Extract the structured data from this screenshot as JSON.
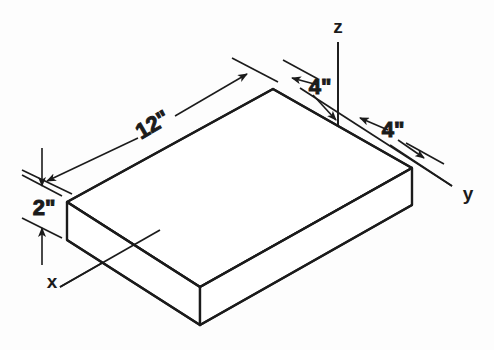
{
  "figure": {
    "background_color": "#fdfdfd",
    "line_color": "#1b1b1b",
    "solid": {
      "name": "rectangular-block",
      "shape": "rectangular-prism"
    },
    "dimensions": [
      {
        "id": "length",
        "label": "12\"",
        "value": 12,
        "unit": "inch",
        "edge": "long-top-edge"
      },
      {
        "id": "thickness",
        "label": "2\"",
        "value": 2,
        "unit": "inch",
        "edge": "vertical-left-edge"
      },
      {
        "id": "width-back",
        "label": "4\"",
        "value": 4,
        "unit": "inch",
        "edge": "back-top-edge"
      },
      {
        "id": "width-front",
        "label": "4\"",
        "value": 4,
        "unit": "inch",
        "edge": "right-top-edge"
      }
    ],
    "axes": [
      {
        "id": "z",
        "label": "z",
        "direction": "vertical-up"
      },
      {
        "id": "y",
        "label": "y",
        "direction": "lower-right"
      },
      {
        "id": "x",
        "label": "x",
        "direction": "lower-left"
      }
    ]
  }
}
